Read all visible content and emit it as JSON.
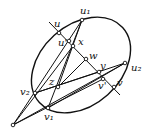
{
  "diagram": {
    "labels": {
      "u1": "u₁",
      "u": "u",
      "u_prime": "u'",
      "x": "x",
      "w": "w",
      "y": "y",
      "u2": "u₂",
      "v_prime": "v'",
      "v": "v",
      "z": "z",
      "v2": "v₂",
      "v1": "v₁"
    },
    "colors": {
      "stroke": "#111111",
      "background": "#ffffff"
    }
  }
}
